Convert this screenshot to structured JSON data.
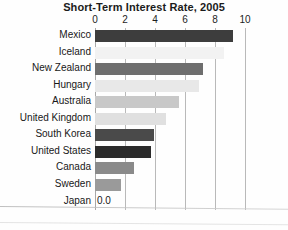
{
  "chart_data": {
    "type": "bar",
    "orientation": "horizontal",
    "title": "Short-Term Interest Rate, 2005",
    "xlabel": "",
    "ylabel": "",
    "xlim": [
      0,
      10
    ],
    "xticks": [
      0,
      2,
      4,
      6,
      8,
      10
    ],
    "xtick_labels": [
      "0",
      "2",
      "4",
      "6",
      "8",
      "10"
    ],
    "grid": true,
    "legend": false,
    "categories": [
      "Mexico",
      "Iceland",
      "New Zealand",
      "Hungary",
      "Australia",
      "United Kingdom",
      "South Korea",
      "United States",
      "Canada",
      "Sweden",
      "Japan"
    ],
    "values": [
      9.2,
      8.6,
      7.2,
      6.9,
      5.6,
      4.7,
      3.9,
      3.7,
      2.6,
      1.7,
      0.0
    ],
    "bar_colors": [
      "#3d3d3d",
      "#f2f2f2",
      "#6e6e6e",
      "#e8e8e8",
      "#c8c8c8",
      "#e0e0e0",
      "#4a4a4a",
      "#2b2b2b",
      "#8a8a8a",
      "#9a9a9a",
      "#ffffff"
    ],
    "data_labels": [
      "",
      "",
      "",
      "",
      "",
      "",
      "",
      "",
      "",
      "",
      "0.0"
    ],
    "axis_color": "#b9b9b9",
    "text_color": "#181818",
    "background": "#fefefe"
  }
}
